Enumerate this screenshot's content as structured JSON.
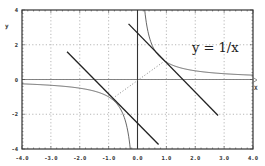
{
  "chart_data": {
    "type": "line",
    "title": "",
    "xlabel": "X",
    "ylabel": "y",
    "xlim": [
      -4.0,
      4.0
    ],
    "ylim": [
      -4,
      4
    ],
    "grid": true,
    "grid_style": "dotted",
    "legend": null,
    "x_ticks": [
      -4.0,
      -3.0,
      -2.0,
      -1.0,
      0.0,
      1.0,
      2.0,
      3.0,
      4.0
    ],
    "x_tick_labels": [
      "-4.0",
      "-3.0",
      "-2.0",
      "-1.0",
      "0.0",
      "1.0",
      "2.0",
      "3.0",
      "4.0"
    ],
    "y_ticks": [
      4,
      2,
      0,
      -2,
      -4
    ],
    "y_tick_labels": [
      "4",
      "2",
      "0",
      "-2",
      "-4"
    ],
    "annotations": [
      {
        "text": "y = 1/x",
        "x": 2.3,
        "y": 1.85
      }
    ],
    "series": [
      {
        "name": "y = 1/x",
        "kind": "function",
        "expression": "1/x",
        "domain": [
          [
            -4.0,
            -0.25
          ],
          [
            0.25,
            4.0
          ]
        ],
        "style": "solid",
        "color": "#555555"
      },
      {
        "name": "upper line",
        "kind": "segment",
        "points": [
          [
            -0.31,
            3.2
          ],
          [
            2.79,
            -2.07
          ]
        ],
        "style": "solid",
        "color": "#222222"
      },
      {
        "name": "lower line",
        "kind": "segment",
        "points": [
          [
            -2.44,
            1.6
          ],
          [
            0.73,
            -3.74
          ]
        ],
        "style": "solid",
        "color": "#222222"
      },
      {
        "name": "y = x segment",
        "kind": "segment",
        "points": [
          [
            -0.77,
            -0.98
          ],
          [
            0.91,
            1.03
          ]
        ],
        "style": "dotted",
        "color": "#666666"
      }
    ]
  },
  "colors": {
    "frame": "#333333",
    "grid": "#999999",
    "axis": "#777777",
    "curve": "#555555",
    "lines": "#222222"
  }
}
